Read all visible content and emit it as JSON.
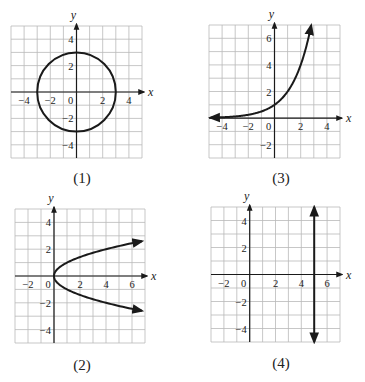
{
  "chart_data": [
    {
      "id": "1",
      "caption": "(1)",
      "type": "line",
      "description": "circle centered at origin, radius 3",
      "equation": "x^2 + y^2 = 9",
      "xlabel": "x",
      "ylabel": "y",
      "xlim": [
        -5,
        5
      ],
      "ylim": [
        -5,
        5
      ],
      "grid": true,
      "x_ticks": [
        -4,
        -2,
        0,
        2,
        4
      ],
      "x_tick_labels": [
        "−4",
        "−2",
        "0",
        "2",
        "4"
      ],
      "y_ticks": [
        4,
        2,
        -2,
        -4
      ],
      "y_tick_labels": [
        "4",
        "2",
        "−2",
        "−4"
      ],
      "series": [
        {
          "name": "circle",
          "shape": "circle",
          "center": [
            0,
            0
          ],
          "radius": 3,
          "arrows": "none"
        }
      ],
      "frame": {
        "left": 11,
        "top": 26,
        "right": 142,
        "bottom": 158
      }
    },
    {
      "id": "3",
      "caption": "(3)",
      "type": "line",
      "description": "exponential curve through (0,1)",
      "equation": "y = 2^x",
      "xlabel": "x",
      "ylabel": "y",
      "xlim": [
        -5,
        5
      ],
      "ylim": [
        -3,
        7
      ],
      "grid": true,
      "x_ticks": [
        -4,
        -2,
        0,
        2,
        4
      ],
      "x_tick_labels": [
        "−4",
        "−2",
        "0",
        "2",
        "4"
      ],
      "y_ticks": [
        6,
        4,
        2,
        -2
      ],
      "y_tick_labels": [
        "6",
        "4",
        "2",
        "−2"
      ],
      "series": [
        {
          "name": "exponential",
          "shape": "function",
          "fn": "exp2",
          "x_range": [
            -4.9,
            2.8
          ],
          "arrows": "both",
          "points": [
            [
              -4.9,
              0.03
            ],
            [
              -4,
              0.06
            ],
            [
              -3,
              0.13
            ],
            [
              -2,
              0.25
            ],
            [
              -1,
              0.5
            ],
            [
              0,
              1
            ],
            [
              1,
              2
            ],
            [
              2,
              4
            ],
            [
              2.5,
              5.66
            ],
            [
              2.8,
              6.96
            ]
          ]
        }
      ],
      "frame": {
        "left": 209,
        "top": 25,
        "right": 340,
        "bottom": 158
      }
    },
    {
      "id": "2",
      "caption": "(2)",
      "type": "line",
      "description": "sideways parabola opening right, vertex at origin",
      "equation": "y^2 = x",
      "xlabel": "x",
      "ylabel": "y",
      "xlim": [
        -3,
        7
      ],
      "ylim": [
        -5,
        5
      ],
      "grid": true,
      "x_ticks": [
        -2,
        0,
        2,
        4,
        6
      ],
      "x_tick_labels": [
        "−2",
        "0",
        "2",
        "4",
        "6"
      ],
      "y_ticks": [
        4,
        2,
        -2,
        -4
      ],
      "y_tick_labels": [
        "4",
        "2",
        "−2",
        "−4"
      ],
      "series": [
        {
          "name": "parabola",
          "shape": "sideways-parabola",
          "y_range": [
            -2.6,
            2.6
          ],
          "arrows": "both-ends",
          "points": [
            [
              6.8,
              2.6
            ],
            [
              4,
              2
            ],
            [
              1,
              1
            ],
            [
              0,
              0
            ],
            [
              1,
              -1
            ],
            [
              4,
              -2
            ],
            [
              6.8,
              -2.6
            ]
          ]
        }
      ],
      "frame": {
        "left": 15,
        "top": 209,
        "right": 145,
        "bottom": 343
      }
    },
    {
      "id": "4",
      "caption": "(4)",
      "type": "line",
      "description": "vertical line at x = 5",
      "equation": "x = 5",
      "xlabel": "x",
      "ylabel": "y",
      "xlim": [
        -3,
        7
      ],
      "ylim": [
        -5,
        5
      ],
      "grid": true,
      "x_ticks": [
        -2,
        0,
        2,
        4,
        6
      ],
      "x_tick_labels": [
        "−2",
        "0",
        "2",
        "4",
        "6"
      ],
      "y_ticks": [
        4,
        2,
        -2,
        -4
      ],
      "y_tick_labels": [
        "4",
        "2",
        "−2",
        "−4"
      ],
      "series": [
        {
          "name": "vertical-line",
          "shape": "vline",
          "x": 5,
          "y_range": [
            -5,
            5
          ],
          "arrows": "both",
          "points": [
            [
              5,
              -5
            ],
            [
              5,
              5
            ]
          ]
        }
      ],
      "frame": {
        "left": 211,
        "top": 207,
        "right": 340,
        "bottom": 342
      }
    }
  ],
  "captions": {
    "g1": "(1)",
    "g2": "(2)",
    "g3": "(3)",
    "g4": "(4)"
  }
}
